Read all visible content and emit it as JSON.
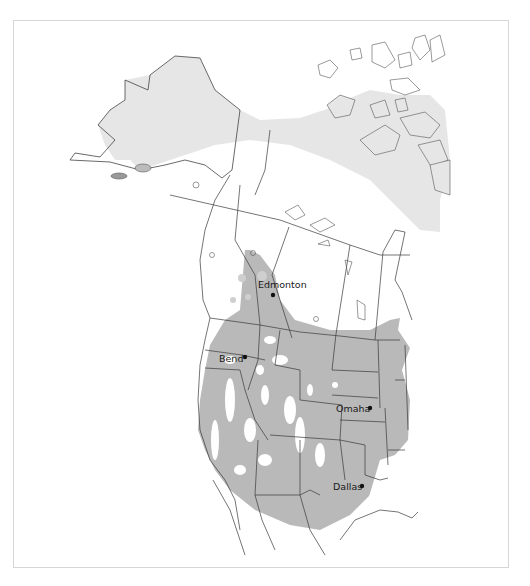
{
  "map": {
    "type": "species range map",
    "region": "North America",
    "colors": {
      "range_primary": "#b9b9b9",
      "range_secondary": "#e6e6e6",
      "land": "#ffffff",
      "border": "#3a3a3a",
      "frame": "#d6d6d6"
    },
    "cities": [
      {
        "name": "Edmonton",
        "x": 273,
        "y": 295
      },
      {
        "name": "Bend",
        "x": 245,
        "y": 357
      },
      {
        "name": "Omaha",
        "x": 370,
        "y": 408
      },
      {
        "name": "Dallas",
        "x": 362,
        "y": 486
      }
    ]
  }
}
